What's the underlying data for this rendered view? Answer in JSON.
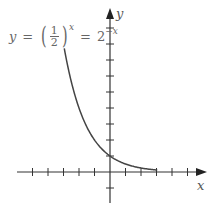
{
  "equation": {
    "lhs": "y",
    "equals": "=",
    "frac_num": "1",
    "frac_den": "2",
    "exp": "x",
    "equals2": "=",
    "rhs_base": "2",
    "rhs_exp": "−x"
  },
  "axes": {
    "x_label": "x",
    "y_label": "y"
  },
  "chart_data": {
    "type": "line",
    "xlabel": "x",
    "ylabel": "y",
    "function": "2^(-x)",
    "x": [
      -3,
      -2,
      -1,
      0,
      1,
      2,
      3
    ],
    "values": [
      8,
      4,
      2,
      1,
      0.5,
      0.25,
      0.125
    ],
    "xlim": [
      -5,
      6
    ],
    "ylim": [
      -2,
      9
    ],
    "x_ticks": [
      -5,
      -4,
      -3,
      -2,
      -1,
      1,
      2,
      3,
      4,
      5
    ],
    "y_ticks": [
      -1,
      1,
      2,
      3,
      4,
      5,
      6,
      7,
      8,
      9
    ],
    "grid": false,
    "colors": {
      "curve": "#444444",
      "axes": "#333333"
    }
  }
}
